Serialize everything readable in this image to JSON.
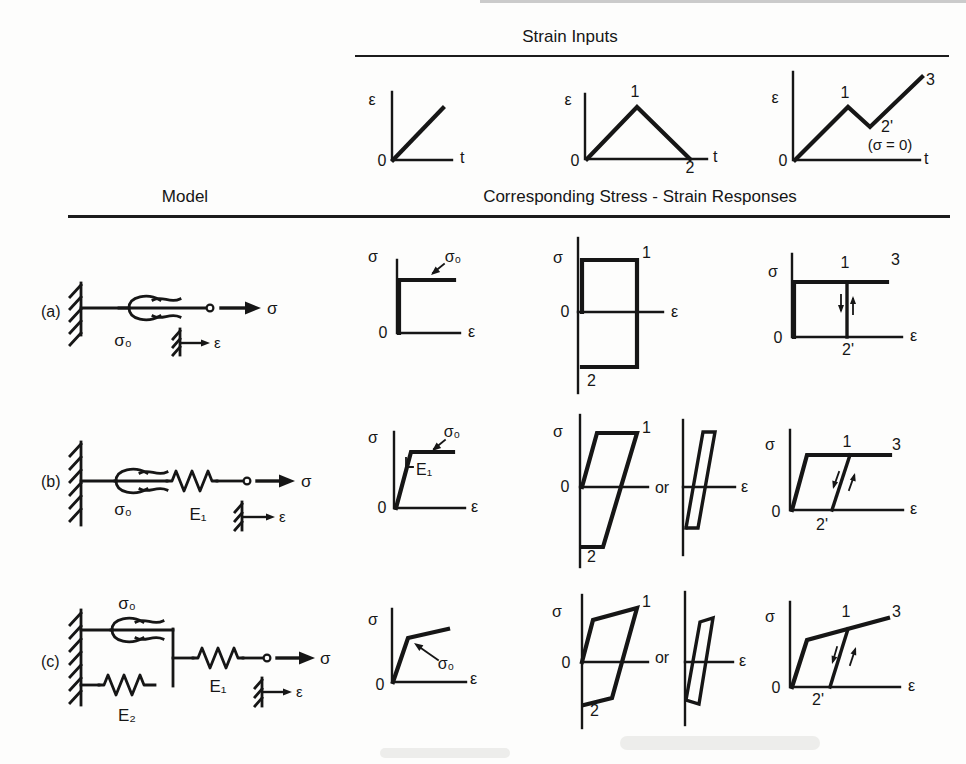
{
  "colors": {
    "ink": "#161616",
    "paper": "#fdfdfc"
  },
  "headers": {
    "strain_inputs": "Strain Inputs",
    "model": "Model",
    "responses": "Corresponding Stress - Strain Responses"
  },
  "strain_plots": {
    "ramp": {
      "ylabel": "ε",
      "xlabel": "t",
      "origin": "0"
    },
    "cycle": {
      "ylabel": "ε",
      "xlabel": "t",
      "origin": "0",
      "peak": "1",
      "end": "2"
    },
    "reload": {
      "ylabel": "ε",
      "xlabel": "t",
      "origin": "0",
      "peak": "1",
      "valley": "2'",
      "note": "(σ = 0)",
      "end": "3"
    }
  },
  "rows": {
    "a": {
      "tag": "(a)",
      "model": {
        "slider": "σ₀",
        "sigma": "σ",
        "epsilon": "ε"
      },
      "mono": {
        "ylabel": "σ",
        "xlabel": "ε",
        "origin": "0",
        "yield": "σ₀"
      },
      "cycle": {
        "ylabel": "σ",
        "xlabel": "ε",
        "origin": "0",
        "p1": "1",
        "p2": "2"
      },
      "reload": {
        "ylabel": "σ",
        "xlabel": "ε",
        "origin": "0",
        "p1": "1",
        "p2": "2'",
        "p3": "3"
      }
    },
    "b": {
      "tag": "(b)",
      "model": {
        "slider": "σ₀",
        "spring": "E₁",
        "sigma": "σ",
        "epsilon": "ε"
      },
      "mono": {
        "ylabel": "σ",
        "xlabel": "ε",
        "origin": "0",
        "yield": "σ₀",
        "slope": "E₁"
      },
      "cycle": {
        "ylabel": "σ",
        "origin": "0",
        "p1": "1",
        "p2": "2"
      },
      "or": "or",
      "alt": {
        "xlabel": "ε"
      },
      "reload": {
        "ylabel": "σ",
        "xlabel": "ε",
        "origin": "0",
        "p1": "1",
        "p2": "2'",
        "p3": "3"
      }
    },
    "c": {
      "tag": "(c)",
      "model": {
        "slider": "σ₀",
        "spring1": "E₁",
        "spring2": "E₂",
        "sigma": "σ",
        "epsilon": "ε"
      },
      "mono": {
        "ylabel": "σ",
        "xlabel": "ε",
        "origin": "0",
        "yield": "σ₀"
      },
      "cycle": {
        "ylabel": "σ",
        "origin": "0",
        "p1": "1",
        "p2": "2"
      },
      "or": "or",
      "alt": {
        "xlabel": "ε"
      },
      "reload": {
        "ylabel": "σ",
        "xlabel": "ε",
        "origin": "0",
        "p1": "1",
        "p2": "2'",
        "p3": "3"
      }
    }
  }
}
